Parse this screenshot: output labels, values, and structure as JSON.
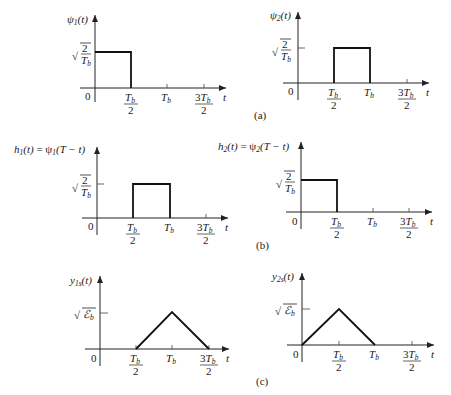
{
  "figure": {
    "panels": [
      {
        "id": "a",
        "caption": "(a)"
      },
      {
        "id": "b",
        "caption": "(b)"
      },
      {
        "id": "c",
        "caption": "(c)"
      }
    ],
    "graphs": [
      {
        "name": "psi1",
        "ylabel": "ψ₁(t)",
        "level_label": "√(2/T_b)",
        "shape": "rect",
        "from": "0",
        "to": "T_b/2"
      },
      {
        "name": "psi2",
        "ylabel": "ψ₂(t)",
        "level_label": "√(2/T_b)",
        "shape": "rect",
        "from": "T_b/2",
        "to": "T_b"
      },
      {
        "name": "h1",
        "ylabel": "h₁(t) = ψ₁(T − t)",
        "level_label": "√(2/T_b)",
        "shape": "rect",
        "from": "T_b/2",
        "to": "T_b"
      },
      {
        "name": "h2",
        "ylabel": "h₂(t) = ψ₂(T − t)",
        "level_label": "√(2/T_b)",
        "shape": "rect",
        "from": "0",
        "to": "T_b/2"
      },
      {
        "name": "y1s",
        "ylabel": "y₁ₛ(t)",
        "level_label": "√ℰ_b",
        "shape": "triangle",
        "from": "T_b/2",
        "peak": "T_b",
        "to": "3T_b/2"
      },
      {
        "name": "y2s",
        "ylabel": "y₂ₛ(t)",
        "level_label": "√ℰ_b",
        "shape": "triangle",
        "from": "0",
        "peak": "T_b/2",
        "to": "T_b"
      }
    ],
    "axis": {
      "origin": "0",
      "t_label": "t",
      "tick_labels": [
        "T_b/2",
        "T_b",
        "3T_b/2"
      ]
    }
  },
  "text": {
    "origin": "0",
    "t": "t",
    "tb": "T",
    "b": "b",
    "two": "2",
    "three": "3",
    "caption_a": "(a)",
    "caption_b": "(b)",
    "caption_c": "(c)",
    "psi": "ψ",
    "one": "1",
    "paren_t": "(t)",
    "h": "h",
    "eq_psi": " = ψ",
    "T_minus_t": "(T − t)",
    "y": "y",
    "sub1s": "1s",
    "sub2s": "2s",
    "radical": "√",
    "energy": "ℰ"
  }
}
